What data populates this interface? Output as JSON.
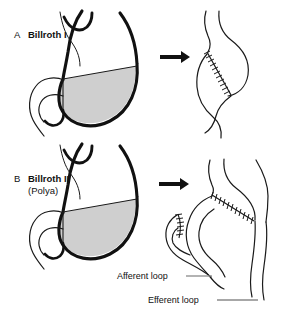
{
  "figure": {
    "background_color": "#ffffff",
    "panels": [
      {
        "id": "panel-a",
        "letter": "A",
        "name": "Billroth I",
        "subtitle": "",
        "resected_fill": "#cfcfcf",
        "outline_color": "#111111",
        "arrow": "right-arrow",
        "preop_caption": "stomach with shaded distal resection segment and duodenum",
        "postop_caption": "gastroduodenostomy with diagonal suture line"
      },
      {
        "id": "panel-b",
        "letter": "B",
        "name": "Billroth II",
        "subtitle": "(Polya)",
        "resected_fill": "#cfcfcf",
        "outline_color": "#111111",
        "arrow": "right-arrow",
        "preop_caption": "stomach with shaded distal resection segment and duodenum",
        "postop_caption": "gastrojejunostomy with closed duodenal stump and jejunal loop"
      }
    ],
    "callouts": [
      {
        "id": "afferent",
        "label": "Afferent loop",
        "leader_color": "#8a8a8a"
      },
      {
        "id": "efferent",
        "label": "Efferent loop",
        "leader_color": "#8a8a8a"
      }
    ],
    "colors": {
      "ink": "#111111",
      "resection_gray": "#cfcfcf",
      "leader_gray": "#8a8a8a",
      "thin_line": "#1a1a1a"
    }
  }
}
